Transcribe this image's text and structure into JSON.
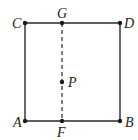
{
  "diagram": {
    "type": "geometry-square",
    "colors": {
      "line": "#2a2a2a",
      "background": "#ffffff"
    },
    "points": {
      "A": {
        "label": "A",
        "x": 25,
        "y": 121
      },
      "B": {
        "label": "B",
        "x": 120,
        "y": 121
      },
      "C": {
        "label": "C",
        "x": 25,
        "y": 23
      },
      "D": {
        "label": "D",
        "x": 120,
        "y": 23
      },
      "G": {
        "label": "G",
        "x": 62,
        "y": 23
      },
      "F": {
        "label": "F",
        "x": 62,
        "y": 121
      },
      "P": {
        "label": "P",
        "x": 62,
        "y": 82
      }
    },
    "segments": [
      {
        "from": "A",
        "to": "B",
        "style": "solid"
      },
      {
        "from": "B",
        "to": "D",
        "style": "solid"
      },
      {
        "from": "D",
        "to": "C",
        "style": "solid"
      },
      {
        "from": "C",
        "to": "A",
        "style": "solid"
      },
      {
        "from": "G",
        "to": "F",
        "style": "dashed"
      }
    ]
  }
}
